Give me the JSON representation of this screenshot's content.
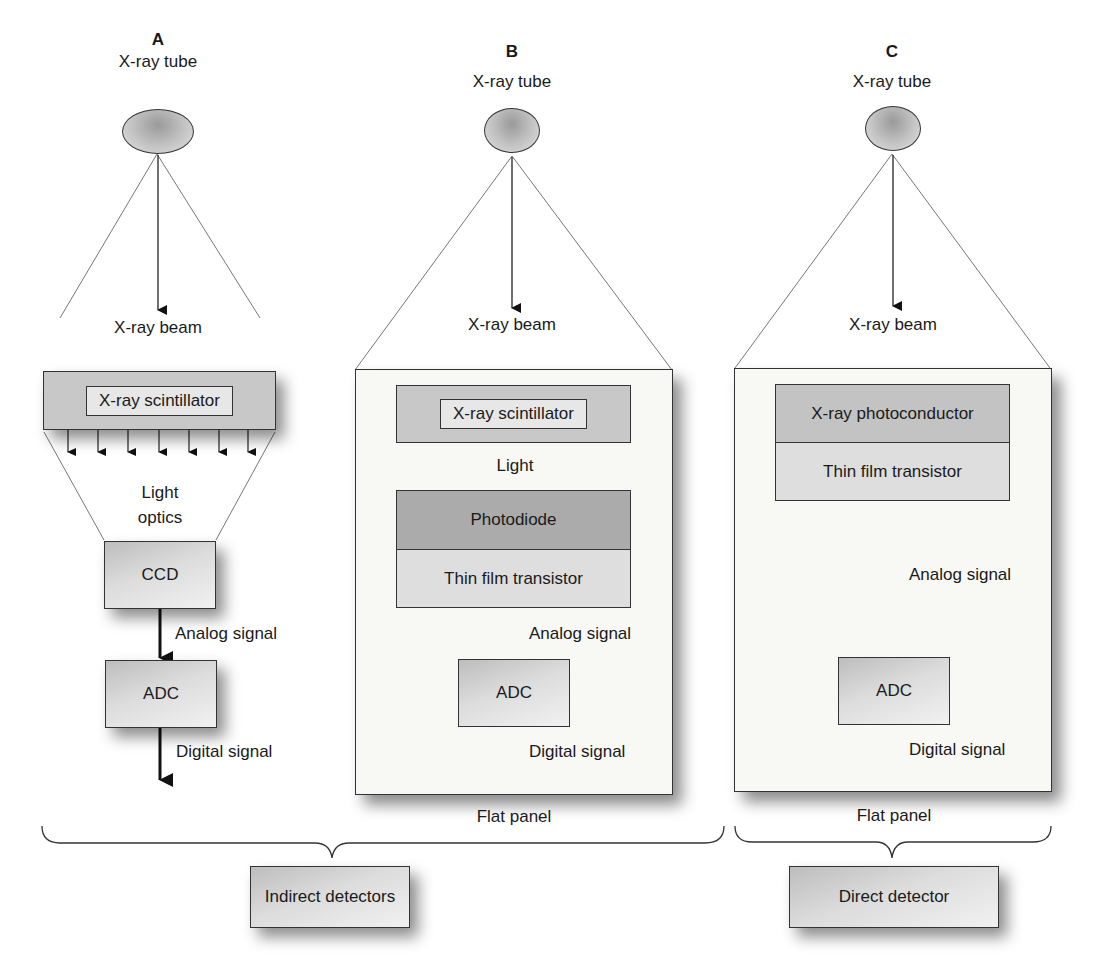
{
  "figure": {
    "panels": [
      {
        "letter": "A",
        "tube_label": "X-ray tube",
        "beam_label": "X-ray beam",
        "scintillator_label": "X-ray scintillator",
        "optics_label_line1": "Light",
        "optics_label_line2": "optics",
        "ccd_label": "CCD",
        "analog_label": "Analog signal",
        "adc_label": "ADC",
        "digital_label": "Digital signal"
      },
      {
        "letter": "B",
        "tube_label": "X-ray tube",
        "beam_label": "X-ray beam",
        "scintillator_label": "X-ray scintillator",
        "light_label": "Light",
        "photodiode_label": "Photodiode",
        "tft_label": "Thin film transistor",
        "analog_label": "Analog signal",
        "adc_label": "ADC",
        "digital_label": "Digital signal",
        "panel_caption": "Flat panel"
      },
      {
        "letter": "C",
        "tube_label": "X-ray tube",
        "beam_label": "X-ray beam",
        "photoconductor_label": "X-ray photoconductor",
        "tft_label": "Thin film transistor",
        "analog_label": "Analog signal",
        "adc_label": "ADC",
        "digital_label": "Digital signal",
        "panel_caption": "Flat panel"
      }
    ],
    "groups": {
      "indirect_label": "Indirect detectors",
      "direct_label": "Direct detector"
    }
  }
}
